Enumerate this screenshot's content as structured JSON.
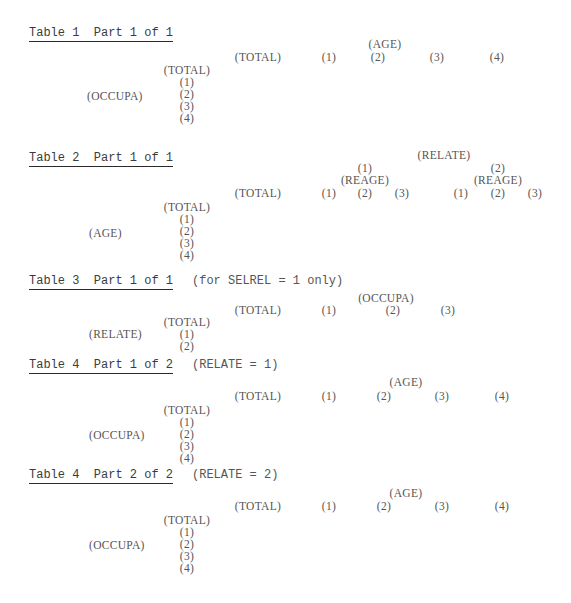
{
  "tables": [
    {
      "title": "Table 1  Part 1 of 1",
      "condition": "",
      "column_variable": "(AGE)",
      "column_headers": [
        "(TOTAL)",
        "(1)",
        "(2)",
        "(3)",
        "(4)"
      ],
      "row_variable": "(OCCUPA)",
      "row_headers": [
        "(TOTAL)",
        "(1)",
        "(2)",
        "(3)",
        "(4)"
      ]
    },
    {
      "title": "Table 2  Part 1 of 1",
      "condition": "",
      "column_variable": "(RELATE)",
      "column_total": "(TOTAL)",
      "column_groups": [
        {
          "label": "(1)",
          "sub_variable": "(REAGE)",
          "sub_headers": [
            "(1)",
            "(2)",
            "(3)"
          ]
        },
        {
          "label": "(2)",
          "sub_variable": "(REAGE)",
          "sub_headers": [
            "(1)",
            "(2)",
            "(3)"
          ]
        }
      ],
      "row_variable": "(AGE)",
      "row_headers": [
        "(TOTAL)",
        "(1)",
        "(2)",
        "(3)",
        "(4)"
      ]
    },
    {
      "title": "Table 3  Part 1 of 1",
      "condition": "(for SELREL = 1 only)",
      "column_variable": "(OCCUPA)",
      "column_headers": [
        "(TOTAL)",
        "(1)",
        "(2)",
        "(3)"
      ],
      "row_variable": "(RELATE)",
      "row_headers": [
        "(TOTAL)",
        "(1)",
        "(2)"
      ]
    },
    {
      "title": "Table 4  Part 1 of 2",
      "condition": "(RELATE = 1)",
      "column_variable": "(AGE)",
      "column_headers": [
        "(TOTAL)",
        "(1)",
        "(2)",
        "(3)",
        "(4)"
      ],
      "row_variable": "(OCCUPA)",
      "row_headers": [
        "(TOTAL)",
        "(1)",
        "(2)",
        "(3)",
        "(4)"
      ]
    },
    {
      "title": "Table 4  Part 2 of 2",
      "condition": "(RELATE = 2)",
      "column_variable": "(AGE)",
      "column_headers": [
        "(TOTAL)",
        "(1)",
        "(2)",
        "(3)",
        "(4)"
      ],
      "row_variable": "(OCCUPA)",
      "row_headers": [
        "(TOTAL)",
        "(1)",
        "(2)",
        "(3)",
        "(4)"
      ]
    }
  ]
}
